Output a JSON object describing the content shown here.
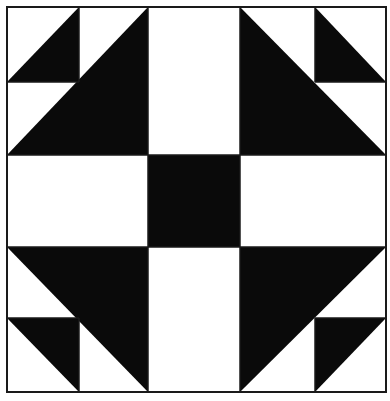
{
  "diagram": {
    "type": "quilt-block",
    "title": "",
    "colors": {
      "background": "#ffffff",
      "fill": "#0a0a0a",
      "line": "#1a1a1a"
    },
    "frame": {
      "x": 7,
      "y": 7,
      "width": 379,
      "height": 385
    },
    "columns": [
      7,
      79,
      148,
      240,
      315,
      386
    ],
    "rows": [
      7,
      82,
      155,
      247,
      318,
      392
    ],
    "center_square": {
      "x": 148,
      "y": 155,
      "width": 92,
      "height": 92
    },
    "triangles": [
      {
        "name": "top-left-large",
        "points": "7,155 148,7 148,155"
      },
      {
        "name": "top-left-small",
        "points": "7,82 79,7 79,82"
      },
      {
        "name": "top-right-large",
        "points": "240,7 240,155 386,155"
      },
      {
        "name": "top-right-small",
        "points": "315,7 315,82 386,82"
      },
      {
        "name": "bottom-left-large",
        "points": "7,247 148,247 148,392"
      },
      {
        "name": "bottom-left-small",
        "points": "7,318 79,318 79,392"
      },
      {
        "name": "bottom-right-large",
        "points": "240,247 386,247 240,392"
      },
      {
        "name": "bottom-right-small",
        "points": "315,318 386,318 315,392"
      }
    ]
  }
}
